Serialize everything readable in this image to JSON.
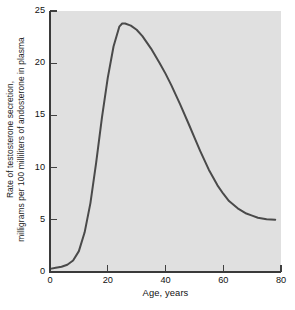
{
  "chart_data": {
    "type": "line",
    "title": "",
    "xlabel": "Age, years",
    "ylabel_line1": "Rate of testosterone secretion,",
    "ylabel_line2": "milligrams per 100 milliliters of andosterone in plasma",
    "xlim": [
      0,
      80
    ],
    "ylim": [
      0,
      25
    ],
    "xticks": [
      0,
      20,
      40,
      60,
      80
    ],
    "yticks": [
      0,
      5,
      10,
      15,
      20,
      25
    ],
    "xtick_labels": [
      "0",
      "20",
      "40",
      "60",
      "80"
    ],
    "ytick_labels": [
      "0",
      "5",
      "10",
      "15",
      "20",
      "25"
    ],
    "grid": false,
    "legend": "none",
    "plot_background": "#e0e0e0",
    "line_color": "#4a4a4a",
    "axis_color": "#404040",
    "text_color": "#111111",
    "series": [
      {
        "name": "Testosterone secretion rate",
        "x": [
          0,
          2,
          4,
          6,
          8,
          10,
          12,
          14,
          16,
          18,
          20,
          22,
          24,
          25,
          26,
          28,
          30,
          32,
          35,
          38,
          40,
          42,
          45,
          48,
          50,
          52,
          55,
          58,
          60,
          62,
          65,
          68,
          70,
          72,
          75,
          78
        ],
        "y": [
          0.3,
          0.4,
          0.5,
          0.7,
          1.1,
          2.0,
          3.8,
          6.6,
          10.5,
          14.8,
          18.6,
          21.6,
          23.5,
          23.8,
          23.8,
          23.6,
          23.2,
          22.6,
          21.4,
          20.0,
          19.0,
          17.9,
          16.1,
          14.2,
          12.9,
          11.6,
          9.8,
          8.3,
          7.5,
          6.8,
          6.1,
          5.6,
          5.4,
          5.2,
          5.05,
          5.0
        ]
      }
    ]
  },
  "axis": {
    "y_title_line1": "Rate of testosterone secretion,",
    "y_title_line2": "milligrams per 100 milliliters of andosterone in plasma",
    "x_title": "Age, years"
  }
}
